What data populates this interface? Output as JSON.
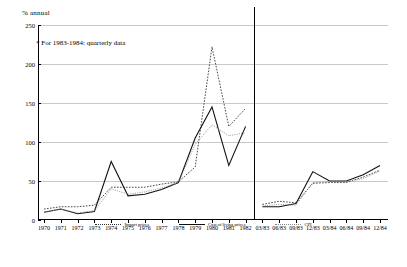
{
  "axis_unit_label": "% annual",
  "note": "* For 1983-1984: quarterly data",
  "legend": {
    "items": [
      {
        "label": "Import prices",
        "style": "dashed"
      },
      {
        "label": "Cost of living prices",
        "style": "solid"
      },
      {
        "label": "CPI",
        "style": "fine-dotted"
      }
    ]
  },
  "chart_data": {
    "type": "line",
    "title": "",
    "xlabel": "",
    "ylabel": "% annual",
    "ylim": [
      0,
      250
    ],
    "yticks": [
      0,
      50,
      100,
      150,
      200,
      250
    ],
    "grid": true,
    "legend_position": "bottom",
    "annotations": [
      "* For 1983-1984: quarterly data"
    ],
    "divider_after_category": "1982",
    "categories": [
      "1970",
      "1971",
      "1972",
      "1973",
      "1974",
      "1975",
      "1976",
      "1977",
      "1978",
      "1979",
      "1980",
      "1981",
      "1982",
      "03/83",
      "06/83",
      "09/83",
      "12/83",
      "03/84",
      "06/84",
      "09/84",
      "12/84"
    ],
    "series": [
      {
        "name": "Import prices",
        "style": "dashed",
        "values": [
          14,
          17,
          17,
          19,
          42,
          42,
          42,
          46,
          49,
          68,
          222,
          120,
          143,
          20,
          24,
          22,
          47,
          48,
          48,
          55,
          64
        ]
      },
      {
        "name": "Cost of living prices",
        "style": "solid",
        "values": [
          10,
          14,
          8,
          11,
          75,
          31,
          33,
          39,
          48,
          105,
          145,
          70,
          120,
          17,
          17,
          21,
          62,
          50,
          50,
          58,
          70
        ]
      },
      {
        "name": "CPI",
        "style": "fine-dotted",
        "values": [
          10,
          14,
          9,
          12,
          40,
          33,
          36,
          41,
          48,
          97,
          122,
          108,
          112,
          18,
          20,
          19,
          48,
          49,
          49,
          53,
          63
        ]
      }
    ]
  }
}
